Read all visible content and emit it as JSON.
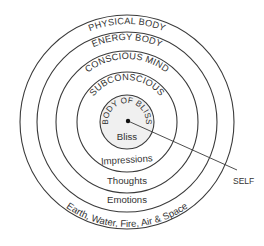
{
  "diagram": {
    "center": {
      "x": 127,
      "y": 122
    },
    "colors": {
      "stroke": "#3a3a3a",
      "core_fill": "#f0f0f0",
      "text": "#333333"
    },
    "layers": [
      {
        "name": "PHYSICAL BODY",
        "content": "Earth, Water, Fire, Air & Space",
        "radius": 107
      },
      {
        "name": "ENERGY BODY",
        "content": "Emotions",
        "radius": 90
      },
      {
        "name": "CONSCIOUS MIND",
        "content": "Thoughts",
        "radius": 71
      },
      {
        "name": "SUBCONSCIOUS",
        "content": "Impressions",
        "radius": 50
      },
      {
        "name": "BODY OF BLISS",
        "content": "Bliss",
        "radius": 27
      }
    ],
    "pointer": {
      "label": "SELF",
      "from": {
        "x": 128,
        "y": 121
      },
      "to": {
        "x": 237,
        "y": 170
      }
    }
  }
}
